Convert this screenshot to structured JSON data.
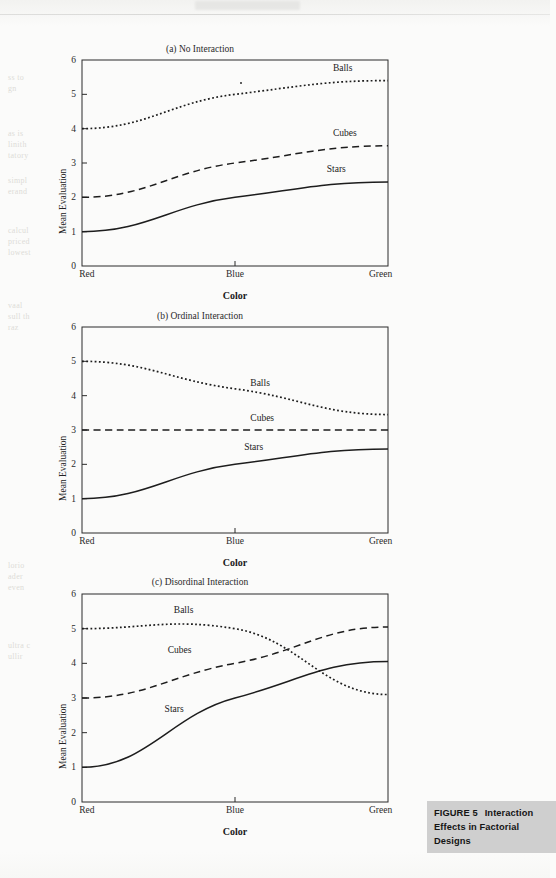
{
  "figure": {
    "caption_number": "FIGURE 5",
    "caption_line1": "Interaction",
    "caption_line2": "Effects in Factorial Designs"
  },
  "axes": {
    "ylabel": "Mean Evaluation",
    "xlabel": "Color",
    "yticks": [
      "0",
      "1",
      "2",
      "3",
      "4",
      "5",
      "6"
    ],
    "xticks": [
      "Red",
      "Blue",
      "Green"
    ]
  },
  "series_names": {
    "balls": "Balls",
    "cubes": "Cubes",
    "stars": "Stars"
  },
  "chart_data": [
    {
      "type": "line",
      "title": "(a) No Interaction",
      "xlabel": "Color",
      "ylabel": "Mean Evaluation",
      "categories": [
        "Red",
        "Blue",
        "Green"
      ],
      "ylim": [
        0,
        6
      ],
      "yticks": [
        0,
        1,
        2,
        3,
        4,
        5,
        6
      ],
      "grid": false,
      "legend": "inline-labels",
      "series": [
        {
          "name": "Balls",
          "values": [
            4.0,
            5.0,
            5.4
          ],
          "style": "dotted"
        },
        {
          "name": "Cubes",
          "values": [
            2.0,
            3.0,
            3.5
          ],
          "style": "dashed"
        },
        {
          "name": "Stars",
          "values": [
            1.0,
            2.0,
            2.45
          ],
          "style": "solid"
        }
      ]
    },
    {
      "type": "line",
      "title": "(b) Ordinal Interaction",
      "xlabel": "Color",
      "ylabel": "Mean Evaluation",
      "categories": [
        "Red",
        "Blue",
        "Green"
      ],
      "ylim": [
        0,
        6
      ],
      "yticks": [
        0,
        1,
        2,
        3,
        4,
        5,
        6
      ],
      "grid": false,
      "legend": "inline-labels",
      "series": [
        {
          "name": "Balls",
          "values": [
            5.0,
            4.2,
            3.45
          ],
          "style": "dotted"
        },
        {
          "name": "Cubes",
          "values": [
            3.0,
            3.0,
            3.0
          ],
          "style": "dashed"
        },
        {
          "name": "Stars",
          "values": [
            1.0,
            2.0,
            2.45
          ],
          "style": "solid"
        }
      ]
    },
    {
      "type": "line",
      "title": "(c) Disordinal Interaction",
      "xlabel": "Color",
      "ylabel": "Mean Evaluation",
      "categories": [
        "Red",
        "Blue",
        "Green"
      ],
      "ylim": [
        0,
        6
      ],
      "yticks": [
        0,
        1,
        2,
        3,
        4,
        5,
        6
      ],
      "grid": false,
      "legend": "inline-labels",
      "series": [
        {
          "name": "Balls",
          "values": [
            5.0,
            5.0,
            3.1
          ],
          "style": "dotted"
        },
        {
          "name": "Cubes",
          "values": [
            3.0,
            4.0,
            5.05
          ],
          "style": "dashed"
        },
        {
          "name": "Stars",
          "values": [
            1.0,
            3.0,
            4.05
          ],
          "style": "solid"
        }
      ]
    }
  ],
  "label_positions": [
    {
      "balls": {
        "x": 0.82,
        "y": 5.72
      },
      "cubes": {
        "x": 0.82,
        "y": 3.82
      },
      "stars": {
        "x": 0.8,
        "y": 2.78
      }
    },
    {
      "balls": {
        "x": 0.55,
        "y": 4.3
      },
      "cubes": {
        "x": 0.55,
        "y": 3.3
      },
      "stars": {
        "x": 0.53,
        "y": 2.45
      }
    },
    {
      "balls": {
        "x": 0.3,
        "y": 5.48
      },
      "cubes": {
        "x": 0.28,
        "y": 4.32
      },
      "stars": {
        "x": 0.27,
        "y": 2.62
      }
    }
  ],
  "ghost_text": [
    "ss to",
    "gn",
    "as is",
    "linith",
    "tatory",
    "simpl",
    "erand",
    "calcul",
    "priced",
    "lowest",
    "vaal",
    "sull th",
    "raz",
    "lorio",
    "ader",
    "even",
    "ultra c",
    "ullir"
  ]
}
